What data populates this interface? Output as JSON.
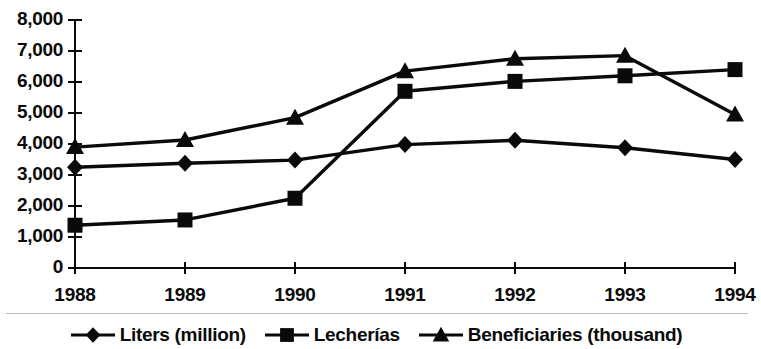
{
  "chart_data": {
    "type": "line",
    "title": "",
    "subtitle": "",
    "xlabel": "",
    "ylabel": "",
    "categories": [
      "1988",
      "1989",
      "1990",
      "1991",
      "1992",
      "1993",
      "1994"
    ],
    "ylim": [
      0,
      8000
    ],
    "y_ticks": [
      0,
      1000,
      2000,
      3000,
      4000,
      5000,
      6000,
      7000,
      8000
    ],
    "y_tick_labels": [
      "0",
      "1,000",
      "2,000",
      "3,000",
      "4,000",
      "5,000",
      "6,000",
      "7,000",
      "8,000"
    ],
    "grid": false,
    "legend_position": "bottom",
    "series": [
      {
        "name": "Liters (million)",
        "marker": "diamond",
        "values": [
          3250,
          3380,
          3480,
          3980,
          4120,
          3880,
          3500
        ]
      },
      {
        "name": "Lecherías",
        "marker": "square",
        "values": [
          1380,
          1550,
          2250,
          5700,
          6020,
          6200,
          6400
        ]
      },
      {
        "name": "Beneficiaries (thousand)",
        "marker": "triangle",
        "values": [
          3900,
          4130,
          4850,
          6350,
          6750,
          6850,
          4950
        ]
      }
    ]
  },
  "style": {
    "line_color": "#0a0a0a",
    "axis_color": "#1a1a1a",
    "background": "#ffffff"
  },
  "legend": {
    "items": [
      {
        "label": "Liters (million)",
        "marker": "diamond"
      },
      {
        "label": "Lecherías",
        "marker": "square"
      },
      {
        "label": "Beneficiaries (thousand)",
        "marker": "triangle"
      }
    ]
  }
}
